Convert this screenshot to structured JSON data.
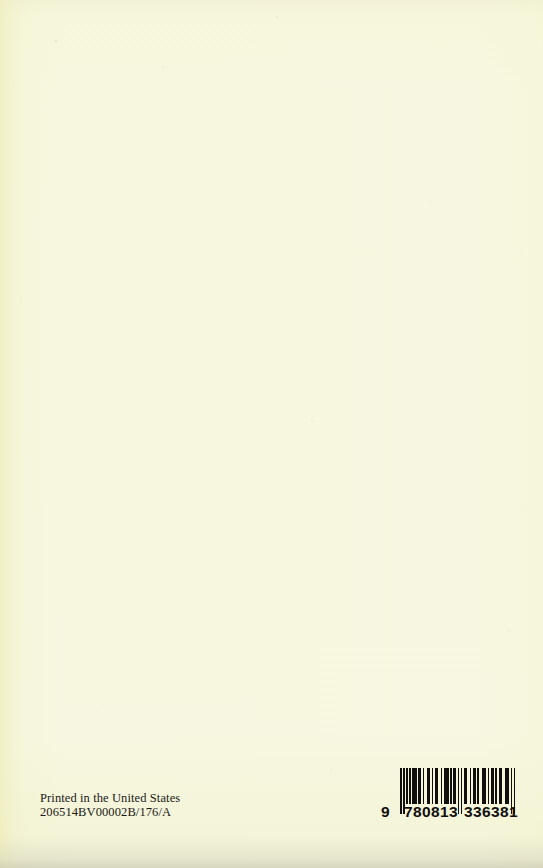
{
  "page": {
    "kind": "book-back-cover",
    "background_color": "#fcfcf3",
    "ink_color": "#100f0d"
  },
  "print_info": {
    "line1": "Printed in the United States",
    "line2": "206514BV00002B/176/A"
  },
  "barcode": {
    "symbology": "EAN-13",
    "lead_digit": "9",
    "left_group": "780813",
    "right_group": "336381",
    "full_number": "9780813336381",
    "human_readable": "9 780813 336381",
    "module_pattern": [
      {
        "w": 1,
        "t": "bar",
        "guard": true
      },
      {
        "w": 1,
        "t": "space"
      },
      {
        "w": 1,
        "t": "bar",
        "guard": true
      },
      {
        "w": 1,
        "t": "space"
      },
      {
        "w": 1,
        "t": "bar"
      },
      {
        "w": 1,
        "t": "space"
      },
      {
        "w": 1,
        "t": "bar"
      },
      {
        "w": 1,
        "t": "space"
      },
      {
        "w": 3,
        "t": "bar"
      },
      {
        "w": 1,
        "t": "space"
      },
      {
        "w": 2,
        "t": "bar"
      },
      {
        "w": 1,
        "t": "space"
      },
      {
        "w": 1,
        "t": "bar"
      },
      {
        "w": 2,
        "t": "space"
      },
      {
        "w": 2,
        "t": "bar"
      },
      {
        "w": 1,
        "t": "space"
      },
      {
        "w": 1,
        "t": "bar"
      },
      {
        "w": 1,
        "t": "space"
      },
      {
        "w": 2,
        "t": "bar"
      },
      {
        "w": 2,
        "t": "space"
      },
      {
        "w": 1,
        "t": "bar"
      },
      {
        "w": 1,
        "t": "space"
      },
      {
        "w": 3,
        "t": "bar"
      },
      {
        "w": 1,
        "t": "space"
      },
      {
        "w": 1,
        "t": "bar"
      },
      {
        "w": 1,
        "t": "space"
      },
      {
        "w": 2,
        "t": "bar"
      },
      {
        "w": 1,
        "t": "space"
      },
      {
        "w": 1,
        "t": "bar",
        "guard": true
      },
      {
        "w": 1,
        "t": "space"
      },
      {
        "w": 1,
        "t": "bar",
        "guard": true
      },
      {
        "w": 1,
        "t": "space"
      },
      {
        "w": 2,
        "t": "bar"
      },
      {
        "w": 2,
        "t": "space"
      },
      {
        "w": 1,
        "t": "bar"
      },
      {
        "w": 1,
        "t": "space"
      },
      {
        "w": 2,
        "t": "bar"
      },
      {
        "w": 1,
        "t": "space"
      },
      {
        "w": 1,
        "t": "bar"
      },
      {
        "w": 2,
        "t": "space"
      },
      {
        "w": 3,
        "t": "bar"
      },
      {
        "w": 1,
        "t": "space"
      },
      {
        "w": 1,
        "t": "bar"
      },
      {
        "w": 1,
        "t": "space"
      },
      {
        "w": 2,
        "t": "bar"
      },
      {
        "w": 1,
        "t": "space"
      },
      {
        "w": 1,
        "t": "bar"
      },
      {
        "w": 1,
        "t": "space"
      },
      {
        "w": 2,
        "t": "bar"
      },
      {
        "w": 2,
        "t": "space"
      },
      {
        "w": 3,
        "t": "bar"
      },
      {
        "w": 1,
        "t": "space"
      },
      {
        "w": 1,
        "t": "bar",
        "guard": true
      },
      {
        "w": 1,
        "t": "space"
      },
      {
        "w": 1,
        "t": "bar",
        "guard": true
      }
    ]
  }
}
